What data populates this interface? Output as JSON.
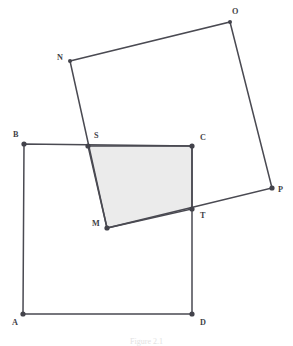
{
  "figure": {
    "caption": "Figure 2.1",
    "canvas": {
      "width": 293,
      "height": 346,
      "background": "#ffffff"
    },
    "style": {
      "stroke_color": "#4a4a52",
      "stroke_width": 1.5,
      "vertex_dot_color": "#43434b",
      "vertex_dot_radius": 2.6,
      "shaded_fill": "#ebebeb",
      "shaded_stroke": "#4a4a52",
      "label_color": "#3f3f47",
      "label_font_size": 8.2
    },
    "shapes": [
      {
        "name": "square-abcd",
        "kind": "square",
        "closed": true,
        "vertices": [
          "A",
          "B",
          "C",
          "D"
        ],
        "points": "23,314 24,144 192,146 192,314"
      },
      {
        "name": "square-nopm",
        "kind": "rotated-square",
        "closed": true,
        "vertices": [
          "N",
          "O",
          "P",
          "M"
        ],
        "points": "70,61 230,22 272,188 107,228"
      },
      {
        "name": "shaded-quadrilateral-sctm",
        "kind": "overlap-region",
        "closed": true,
        "vertices": [
          "S",
          "C",
          "T",
          "M"
        ],
        "points": "88,146 192,146 192,209 107,228"
      }
    ],
    "points": [
      {
        "id": "A",
        "label": "A",
        "x": 23,
        "y": 314,
        "label_x": 12,
        "label_y": 325,
        "role": "square-abcd-vertex"
      },
      {
        "id": "B",
        "label": "B",
        "x": 24,
        "y": 144,
        "label_x": 13,
        "label_y": 137,
        "role": "square-abcd-vertex"
      },
      {
        "id": "C",
        "label": "C",
        "x": 192,
        "y": 146,
        "label_x": 200,
        "label_y": 140,
        "role": "square-abcd-vertex"
      },
      {
        "id": "D",
        "label": "D",
        "x": 192,
        "y": 314,
        "label_x": 200,
        "label_y": 325,
        "role": "square-abcd-vertex"
      },
      {
        "id": "N",
        "label": "N",
        "x": 70,
        "y": 61,
        "label_x": 57,
        "label_y": 60,
        "role": "square-nopm-vertex"
      },
      {
        "id": "O",
        "label": "O",
        "x": 230,
        "y": 22,
        "label_x": 232,
        "label_y": 14,
        "role": "square-nopm-vertex"
      },
      {
        "id": "P",
        "label": "P",
        "x": 272,
        "y": 188,
        "label_x": 278,
        "label_y": 192,
        "role": "square-nopm-vertex"
      },
      {
        "id": "M",
        "label": "M",
        "x": 107,
        "y": 228,
        "label_x": 92,
        "label_y": 226,
        "role": "square-nopm-vertex"
      },
      {
        "id": "S",
        "label": "S",
        "x": 88,
        "y": 146,
        "label_x": 94,
        "label_y": 138,
        "role": "intersection-bc-nm"
      },
      {
        "id": "T",
        "label": "T",
        "x": 192,
        "y": 209,
        "label_x": 200,
        "label_y": 218,
        "role": "intersection-cd-mp"
      }
    ]
  }
}
